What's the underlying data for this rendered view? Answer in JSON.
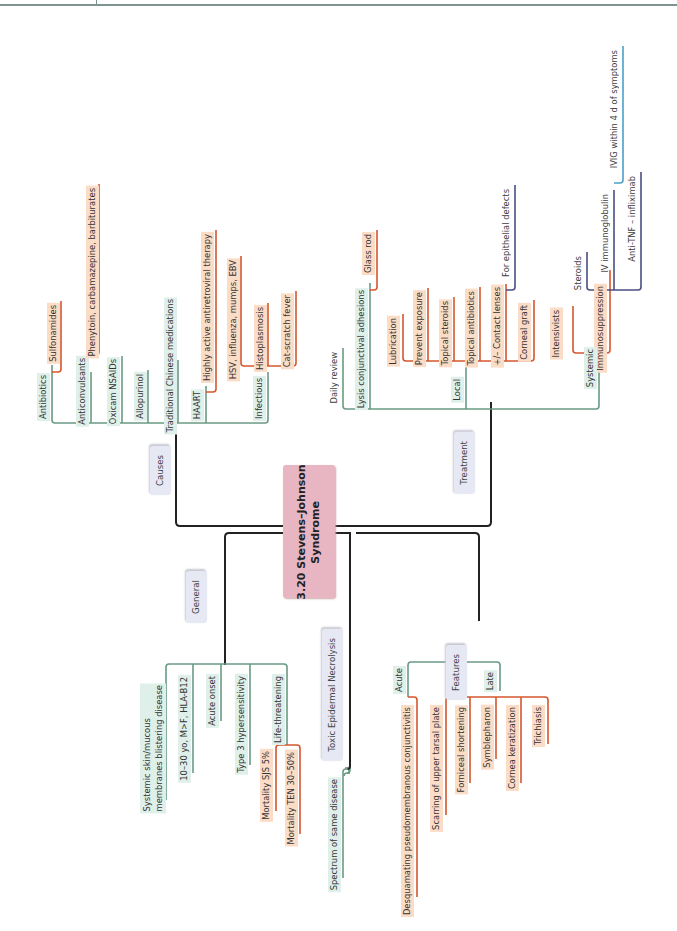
{
  "title_lines": [
    "3.20 Stevens–Johnson",
    "Syndrome"
  ],
  "colors": {
    "trunk": "#222222",
    "green": "#6a9a84",
    "red": "#d4572e",
    "navy": "#4a4f80",
    "blue": "#4aa0c8",
    "title_bg": "#e8b6c3",
    "category_bg": "#e6e8f3"
  },
  "branches": {
    "causes": {
      "label": "Causes",
      "items": [
        {
          "label": "Antibiotics",
          "children": [
            "Sulfonamides"
          ]
        },
        {
          "label": "Anticonvulsants",
          "children": [
            "Phenytoin, carbamazepine, barbiturates"
          ]
        },
        {
          "label": "Oxicam NSAIDs"
        },
        {
          "label": "Allopurinol"
        },
        {
          "label": "Traditional Chinese medications"
        },
        {
          "label": "HAART",
          "children": [
            "Highly active antiretroviral therapy"
          ]
        },
        {
          "label": "Infectious",
          "children": [
            "HSV, influenza, mumps, EBV",
            "Histoplasmosis",
            "Cat-scratch fever"
          ]
        }
      ]
    },
    "treatment": {
      "label": "Treatment",
      "items": [
        {
          "label": "Daily review"
        },
        {
          "label": "Lysis conjunctival adhesions",
          "children": [
            "Glass rod"
          ]
        },
        {
          "label": "Local",
          "children": [
            "Lubrication",
            "Prevent exposure",
            "Topical steroids",
            "Topical antibiotics",
            {
              "label": "+/– Contact lenses",
              "children": [
                "For epithelial defects"
              ]
            },
            "Corneal graft"
          ]
        },
        {
          "label": "Systemic",
          "children": [
            "Intensivists",
            {
              "label": "Immunosuppression",
              "children": [
                "Steroids",
                {
                  "label": "IV immunoglobulin",
                  "children": [
                    "IVIG within 4 d of symptoms"
                  ]
                },
                "Anti-TNF – infliximab"
              ]
            }
          ]
        }
      ]
    },
    "general": {
      "label": "General",
      "items": [
        {
          "label": "Systemic skin/mucous membranes blistering disease",
          "lines": [
            "Systemic skin/mucous",
            "membranes blistering disease"
          ]
        },
        {
          "label": "10–30 yo, M>F, HLA-B12"
        },
        {
          "label": "Acute onset"
        },
        {
          "label": "Type 3 hypersensitivity"
        },
        {
          "label": "Life-threatening",
          "children": [
            "Mortality SJS 5%",
            "Mortality TEN 30–50%"
          ]
        }
      ]
    },
    "ten": {
      "label": "Toxic Epidermal Necrolysis",
      "items": [
        {
          "label": "Spectrum of same disease"
        }
      ]
    },
    "features": {
      "label": "Features",
      "items": [
        {
          "label": "Acute",
          "children": [
            "Desquamating pseudomembranous conjunctivitis"
          ]
        },
        {
          "label": "Late",
          "children": [
            "Scarring of upper tarsal plate",
            "Forniceal shortening",
            "Symblepharon",
            "Cornea keratization",
            "Trichiasis"
          ]
        }
      ]
    }
  }
}
